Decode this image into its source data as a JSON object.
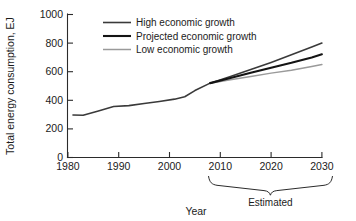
{
  "chart_data": {
    "type": "line",
    "title": "",
    "xlabel": "Year",
    "ylabel": "Total energy consumption, EJ",
    "xlim": [
      1980,
      2030
    ],
    "ylim": [
      0,
      1000
    ],
    "xticks": [
      "1980",
      "1990",
      "2000",
      "2010",
      "2020",
      "2030"
    ],
    "xtick_values": [
      1980,
      1990,
      2000,
      2010,
      2020,
      2030
    ],
    "yticks": [
      "0",
      "200",
      "400",
      "600",
      "800",
      "1000"
    ],
    "ytick_values": [
      0,
      200,
      400,
      600,
      800,
      1000
    ],
    "grid": false,
    "legend_position": "top-center",
    "annotations": [
      {
        "text": "Estimated",
        "type": "brace-below-axis",
        "x_range": [
          2007,
          2031
        ],
        "note": "curly brace under x-axis spanning the projected period"
      }
    ],
    "series": [
      {
        "name": "High economic growth",
        "color": "#3a3a3a",
        "width": 1.6,
        "x": [
          2008,
          2012,
          2016,
          2020,
          2024,
          2028,
          2030
        ],
        "values": [
          520,
          566,
          615,
          665,
          718,
          772,
          800
        ]
      },
      {
        "name": "Projected economic growth",
        "color": "#141414",
        "width": 2.1,
        "x": [
          2008,
          2012,
          2016,
          2020,
          2024,
          2028,
          2030
        ],
        "values": [
          520,
          556,
          592,
          628,
          662,
          700,
          722
        ]
      },
      {
        "name": "Low economic growth",
        "color": "#9a9a9a",
        "width": 1.5,
        "x": [
          2008,
          2012,
          2016,
          2020,
          2024,
          2028,
          2030
        ],
        "values": [
          520,
          544,
          566,
          590,
          610,
          636,
          650
        ]
      },
      {
        "name": "Historical",
        "color": "#3a3a3a",
        "width": 1.6,
        "x": [
          1981,
          1983,
          1986,
          1989,
          1992,
          1995,
          1998,
          2001,
          2003,
          2005,
          2008
        ],
        "values": [
          297,
          295,
          325,
          357,
          363,
          378,
          392,
          408,
          425,
          468,
          520
        ]
      }
    ]
  },
  "legend": {
    "items": [
      {
        "label": "High economic growth",
        "color": "#3a3a3a",
        "width": 1.6
      },
      {
        "label": "Projected economic growth",
        "color": "#141414",
        "width": 2.1
      },
      {
        "label": "Low economic growth",
        "color": "#9a9a9a",
        "width": 1.5
      }
    ]
  },
  "axes": {
    "y_title": "Total energy consumption, EJ",
    "x_title": "Year",
    "y_tick_labels": [
      "1000",
      "800",
      "600",
      "400",
      "200",
      "0"
    ],
    "x_tick_labels": [
      "1980",
      "1990",
      "2000",
      "2010",
      "2020",
      "2030"
    ]
  },
  "estimated_bracket": {
    "label": "Estimated"
  }
}
